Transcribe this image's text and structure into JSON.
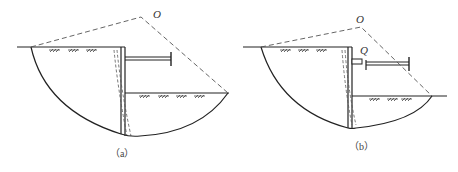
{
  "figures": [
    {
      "id": "a",
      "caption": "（a）",
      "center_label": "O",
      "force_label": null
    },
    {
      "id": "b",
      "caption": "（b）",
      "center_label": "O",
      "force_label": "Q"
    }
  ],
  "colors": {
    "line": "#222222",
    "dashed": "#555555",
    "background": "#ffffff"
  }
}
